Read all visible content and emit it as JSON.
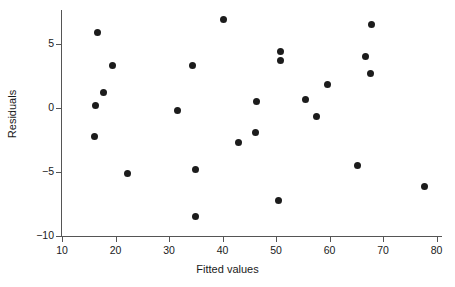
{
  "chart_data": {
    "type": "scatter",
    "title": "",
    "xlabel": "Fitted values",
    "ylabel": "Residuals",
    "xlim": [
      7.5,
      81.5
    ],
    "ylim": [
      -10.4,
      7.6
    ],
    "xticks": [
      10,
      20,
      30,
      40,
      50,
      60,
      70,
      80
    ],
    "xticklabels": [
      "10",
      "20",
      "30",
      "40",
      "50",
      "60",
      "70",
      "80"
    ],
    "yticks": [
      5,
      0,
      -5,
      -10
    ],
    "yticklabels": [
      "5",
      "0",
      "−5",
      "−10"
    ],
    "grid": false,
    "legend": false,
    "marker": "filled-circle",
    "marker_color": "#1c1c1c",
    "axis_color": "#555555",
    "background_color": "#ffffff",
    "points": [
      {
        "x": 16.7,
        "y": 5.9
      },
      {
        "x": 19.4,
        "y": 3.3
      },
      {
        "x": 17.7,
        "y": 1.2
      },
      {
        "x": 16.3,
        "y": 0.2
      },
      {
        "x": 16.0,
        "y": -2.2
      },
      {
        "x": 22.2,
        "y": -5.1
      },
      {
        "x": 31.5,
        "y": -0.2
      },
      {
        "x": 34.3,
        "y": 3.3
      },
      {
        "x": 34.9,
        "y": -4.8
      },
      {
        "x": 34.9,
        "y": -8.5
      },
      {
        "x": 40.1,
        "y": 6.9
      },
      {
        "x": 42.9,
        "y": -2.7
      },
      {
        "x": 46.1,
        "y": -1.9
      },
      {
        "x": 46.4,
        "y": 0.5
      },
      {
        "x": 50.8,
        "y": 4.4
      },
      {
        "x": 50.8,
        "y": 3.7
      },
      {
        "x": 50.4,
        "y": -7.2
      },
      {
        "x": 55.6,
        "y": 0.7
      },
      {
        "x": 59.7,
        "y": 1.8
      },
      {
        "x": 57.6,
        "y": -0.7
      },
      {
        "x": 66.8,
        "y": 4.0
      },
      {
        "x": 67.9,
        "y": 6.5
      },
      {
        "x": 67.6,
        "y": 2.7
      },
      {
        "x": 65.2,
        "y": -4.5
      },
      {
        "x": 77.7,
        "y": -6.1
      }
    ]
  }
}
